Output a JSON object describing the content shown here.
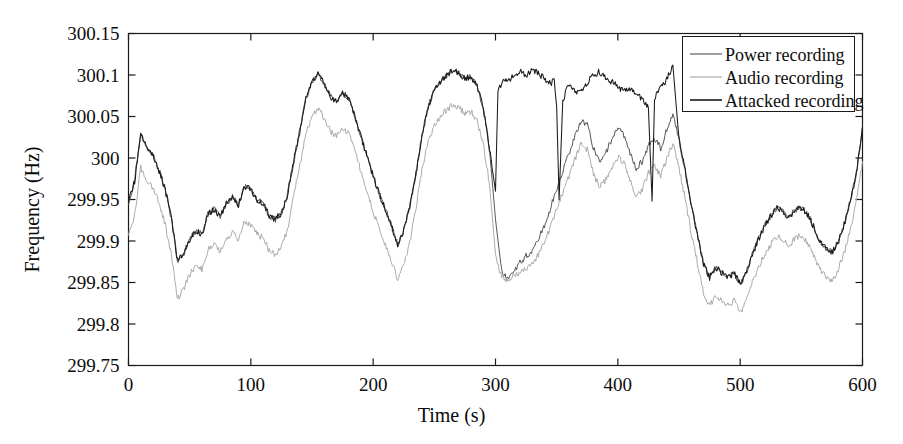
{
  "chart_data": {
    "type": "line",
    "title": "",
    "xlabel": "Time (s)",
    "ylabel": "Frequency (Hz)",
    "xlim": [
      0,
      600
    ],
    "ylim": [
      299.75,
      300.15
    ],
    "xticks": [
      0,
      100,
      200,
      300,
      400,
      500,
      600
    ],
    "yticks": [
      299.75,
      299.8,
      299.85,
      299.9,
      299.95,
      300,
      300.05,
      300.1,
      300.15
    ],
    "xtick_labels": [
      "0",
      "100",
      "200",
      "300",
      "400",
      "500",
      "600"
    ],
    "ytick_labels": [
      "299.75",
      "299.8",
      "299.85",
      "299.9",
      "299.95",
      "300",
      "300.05",
      "300.1",
      "300.15"
    ],
    "grid": false,
    "legend_position": "top-right",
    "series": [
      {
        "name": "Power recording",
        "color": "#4d4d4d",
        "x": [
          0,
          5,
          10,
          15,
          20,
          25,
          30,
          35,
          40,
          45,
          50,
          55,
          60,
          65,
          70,
          75,
          80,
          85,
          90,
          95,
          100,
          105,
          110,
          115,
          120,
          125,
          130,
          135,
          140,
          145,
          150,
          155,
          160,
          165,
          170,
          175,
          180,
          185,
          190,
          195,
          200,
          205,
          210,
          215,
          220,
          225,
          230,
          235,
          240,
          245,
          250,
          255,
          260,
          265,
          270,
          275,
          280,
          285,
          290,
          295,
          300,
          305,
          310,
          315,
          320,
          325,
          330,
          335,
          340,
          345,
          350,
          355,
          360,
          365,
          370,
          375,
          380,
          385,
          390,
          395,
          400,
          405,
          410,
          415,
          420,
          425,
          430,
          435,
          440,
          445,
          450,
          455,
          460,
          465,
          470,
          475,
          480,
          485,
          490,
          495,
          500,
          505,
          510,
          515,
          520,
          525,
          530,
          535,
          540,
          545,
          550,
          555,
          560,
          565,
          570,
          575,
          580,
          585,
          590,
          595,
          600
        ],
        "y": [
          299.947,
          299.972,
          300.028,
          300.012,
          300.004,
          299.985,
          299.962,
          299.928,
          299.876,
          299.884,
          299.902,
          299.912,
          299.908,
          299.932,
          299.938,
          299.93,
          299.946,
          299.952,
          299.944,
          299.966,
          299.962,
          299.95,
          299.946,
          299.93,
          299.926,
          299.934,
          299.956,
          299.996,
          300.032,
          300.072,
          300.092,
          300.102,
          300.09,
          300.074,
          300.068,
          300.078,
          300.072,
          300.05,
          300.026,
          300.002,
          299.978,
          299.956,
          299.938,
          299.918,
          299.896,
          299.912,
          299.942,
          299.982,
          300.028,
          300.062,
          300.082,
          300.092,
          300.1,
          300.106,
          300.102,
          300.096,
          300.098,
          300.086,
          300.06,
          300.012,
          299.926,
          299.864,
          299.856,
          299.862,
          299.874,
          299.882,
          299.886,
          299.902,
          299.918,
          299.94,
          299.962,
          299.984,
          300.006,
          300.026,
          300.046,
          300.04,
          300.012,
          299.994,
          300.006,
          300.022,
          300.036,
          300.028,
          300.006,
          299.988,
          299.996,
          300.016,
          300.024,
          300.012,
          300.034,
          300.052,
          300.022,
          299.986,
          299.944,
          299.908,
          299.872,
          299.856,
          299.868,
          299.862,
          299.856,
          299.862,
          299.848,
          299.862,
          299.884,
          299.902,
          299.918,
          299.93,
          299.94,
          299.936,
          299.928,
          299.938,
          299.94,
          299.932,
          299.918,
          299.9,
          299.892,
          299.886,
          299.898,
          299.92,
          299.948,
          299.982,
          300.038
        ]
      },
      {
        "name": "Audio recording",
        "color": "#a6a6a6",
        "x": [
          0,
          5,
          10,
          15,
          20,
          25,
          30,
          35,
          40,
          45,
          50,
          55,
          60,
          65,
          70,
          75,
          80,
          85,
          90,
          95,
          100,
          105,
          110,
          115,
          120,
          125,
          130,
          135,
          140,
          145,
          150,
          155,
          160,
          165,
          170,
          175,
          180,
          185,
          190,
          195,
          200,
          205,
          210,
          215,
          220,
          225,
          230,
          235,
          240,
          245,
          250,
          255,
          260,
          265,
          270,
          275,
          280,
          285,
          290,
          295,
          300,
          305,
          310,
          315,
          320,
          325,
          330,
          335,
          340,
          345,
          350,
          355,
          360,
          365,
          370,
          375,
          380,
          385,
          390,
          395,
          400,
          405,
          410,
          415,
          420,
          425,
          430,
          435,
          440,
          445,
          450,
          455,
          460,
          465,
          470,
          475,
          480,
          485,
          490,
          495,
          500,
          505,
          510,
          515,
          520,
          525,
          530,
          535,
          540,
          545,
          550,
          555,
          560,
          565,
          570,
          575,
          580,
          585,
          590,
          595,
          600
        ],
        "y": [
          299.906,
          299.932,
          299.988,
          299.972,
          299.964,
          299.946,
          299.92,
          299.884,
          299.83,
          299.842,
          299.86,
          299.87,
          299.866,
          299.89,
          299.896,
          299.888,
          299.904,
          299.91,
          299.902,
          299.924,
          299.92,
          299.908,
          299.904,
          299.888,
          299.884,
          299.892,
          299.914,
          299.954,
          299.99,
          300.03,
          300.05,
          300.06,
          300.048,
          300.032,
          300.026,
          300.036,
          300.03,
          300.008,
          299.984,
          299.96,
          299.936,
          299.914,
          299.896,
          299.876,
          299.854,
          299.87,
          299.9,
          299.94,
          299.986,
          300.02,
          300.04,
          300.05,
          300.058,
          300.064,
          300.06,
          300.054,
          300.056,
          300.044,
          300.018,
          299.97,
          299.884,
          299.856,
          299.852,
          299.858,
          299.862,
          299.866,
          299.872,
          299.884,
          299.898,
          299.916,
          299.938,
          299.958,
          299.978,
          299.998,
          300.018,
          300.01,
          299.982,
          299.964,
          299.974,
          299.988,
          300.002,
          299.994,
          299.972,
          299.954,
          299.962,
          299.982,
          299.99,
          299.978,
          300.0,
          300.018,
          299.988,
          299.952,
          299.91,
          299.874,
          299.838,
          299.822,
          299.834,
          299.828,
          299.822,
          299.828,
          299.814,
          299.828,
          299.85,
          299.868,
          299.884,
          299.896,
          299.906,
          299.902,
          299.894,
          299.904,
          299.906,
          299.898,
          299.884,
          299.866,
          299.858,
          299.852,
          299.864,
          299.886,
          299.914,
          299.948,
          299.996
        ]
      },
      {
        "name": "Attacked recording",
        "color": "#1a1a1a",
        "x": [
          0,
          5,
          10,
          15,
          20,
          25,
          30,
          35,
          40,
          45,
          50,
          55,
          60,
          65,
          70,
          75,
          80,
          85,
          90,
          95,
          100,
          105,
          110,
          115,
          120,
          125,
          130,
          135,
          140,
          145,
          150,
          155,
          160,
          165,
          170,
          175,
          180,
          185,
          190,
          195,
          200,
          205,
          210,
          215,
          220,
          225,
          230,
          235,
          240,
          245,
          250,
          255,
          260,
          265,
          270,
          275,
          280,
          285,
          290,
          295,
          300,
          302,
          305,
          310,
          315,
          320,
          325,
          330,
          335,
          340,
          345,
          348,
          350,
          352,
          355,
          360,
          365,
          370,
          375,
          380,
          385,
          390,
          395,
          400,
          405,
          410,
          415,
          420,
          425,
          428,
          430,
          435,
          440,
          445,
          450,
          455,
          460,
          465,
          470,
          475,
          480,
          485,
          490,
          495,
          500,
          505,
          510,
          515,
          520,
          525,
          530,
          535,
          540,
          545,
          550,
          555,
          560,
          565,
          570,
          575,
          580,
          585,
          590,
          595,
          600
        ],
        "y": [
          299.947,
          299.972,
          300.028,
          300.012,
          300.004,
          299.985,
          299.962,
          299.928,
          299.876,
          299.884,
          299.902,
          299.912,
          299.908,
          299.932,
          299.938,
          299.93,
          299.946,
          299.952,
          299.944,
          299.966,
          299.962,
          299.95,
          299.946,
          299.93,
          299.926,
          299.934,
          299.956,
          299.996,
          300.032,
          300.072,
          300.092,
          300.102,
          300.09,
          300.074,
          300.068,
          300.078,
          300.072,
          300.05,
          300.026,
          300.002,
          299.978,
          299.956,
          299.938,
          299.918,
          299.896,
          299.912,
          299.942,
          299.982,
          300.028,
          300.062,
          300.082,
          300.092,
          300.1,
          300.106,
          300.102,
          300.096,
          300.098,
          300.086,
          300.06,
          300.012,
          299.96,
          300.082,
          300.09,
          300.094,
          300.098,
          300.104,
          300.1,
          300.106,
          300.102,
          300.096,
          300.09,
          300.094,
          300.062,
          299.95,
          300.07,
          300.088,
          300.082,
          300.078,
          300.09,
          300.1,
          300.104,
          300.098,
          300.092,
          300.086,
          300.08,
          300.084,
          300.078,
          300.07,
          300.06,
          299.948,
          300.07,
          300.086,
          300.094,
          300.112,
          300.022,
          299.986,
          299.944,
          299.908,
          299.872,
          299.856,
          299.868,
          299.862,
          299.856,
          299.862,
          299.848,
          299.862,
          299.884,
          299.902,
          299.918,
          299.93,
          299.94,
          299.936,
          299.928,
          299.938,
          299.94,
          299.932,
          299.918,
          299.9,
          299.892,
          299.886,
          299.898,
          299.92,
          299.948,
          299.982,
          300.038
        ]
      }
    ]
  },
  "legend": {
    "entries": [
      {
        "label": "Power recording",
        "color": "#4d4d4d"
      },
      {
        "label": "Audio recording",
        "color": "#a6a6a6"
      },
      {
        "label": "Attacked recording",
        "color": "#1a1a1a"
      }
    ]
  },
  "axes": {
    "x_title": "Time (s)",
    "y_title": "Frequency (Hz)"
  }
}
